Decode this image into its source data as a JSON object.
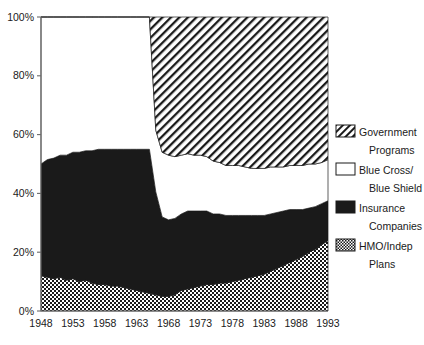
{
  "chart_data": {
    "type": "area",
    "title": "",
    "subtitle": "",
    "xlabel": "",
    "ylabel": "",
    "stacked": true,
    "stack_mode": "percent",
    "grid": false,
    "legend_position": "right",
    "xlim": [
      1948,
      1993
    ],
    "ylim": [
      0,
      100
    ],
    "xticks": [
      "1948",
      "1953",
      "1958",
      "1963",
      "1968",
      "1973",
      "1978",
      "1983",
      "1988",
      "1993"
    ],
    "xtick_values": [
      1948,
      1953,
      1958,
      1963,
      1968,
      1973,
      1978,
      1983,
      1988,
      1993
    ],
    "yticks": [
      "0%",
      "20%",
      "40%",
      "60%",
      "80%",
      "100%"
    ],
    "ytick_values": [
      0,
      20,
      40,
      60,
      80,
      100
    ],
    "x": [
      1948,
      1949,
      1950,
      1951,
      1952,
      1953,
      1954,
      1955,
      1956,
      1957,
      1958,
      1959,
      1960,
      1961,
      1962,
      1963,
      1964,
      1965,
      1966,
      1967,
      1968,
      1969,
      1970,
      1971,
      1972,
      1973,
      1974,
      1975,
      1976,
      1977,
      1978,
      1979,
      1980,
      1981,
      1982,
      1983,
      1984,
      1985,
      1986,
      1987,
      1988,
      1989,
      1990,
      1991,
      1992,
      1993
    ],
    "series": [
      {
        "name": "HMO/Indep Plans",
        "pattern": "checker",
        "order": 1,
        "values": [
          12,
          11.5,
          11,
          11.5,
          10.5,
          11,
          10,
          10.5,
          9.5,
          9,
          9,
          8.5,
          8.5,
          8,
          7.5,
          7,
          6.5,
          6,
          5.5,
          5,
          5,
          5.5,
          7,
          7.5,
          8,
          8.5,
          9,
          9,
          9.5,
          9.5,
          10,
          10.5,
          11,
          11.5,
          12,
          12.5,
          13.5,
          14.5,
          15.5,
          16.5,
          17.5,
          18.5,
          20,
          21,
          22.5,
          24
        ]
      },
      {
        "name": "Insurance Companies",
        "pattern": "solid-black",
        "order": 2,
        "values": [
          38,
          40,
          41,
          41.5,
          42.5,
          43,
          44,
          44,
          45,
          46,
          46,
          46.5,
          46.5,
          47,
          47.5,
          48,
          48.5,
          49,
          35,
          27,
          26,
          26,
          26,
          26.5,
          26,
          25.5,
          25,
          24,
          23.5,
          23,
          22.5,
          22,
          21.5,
          21,
          20.5,
          20,
          19.5,
          19,
          18.5,
          18,
          17,
          16,
          15,
          14.5,
          14,
          13.5
        ]
      },
      {
        "name": "Blue Cross/ Blue Shield",
        "pattern": "white",
        "order": 3,
        "values": [
          50,
          48.5,
          48,
          47,
          47,
          46,
          46,
          45.5,
          45.5,
          45,
          45,
          45,
          45,
          45,
          45,
          45,
          45,
          45,
          21,
          22,
          22,
          21,
          20,
          19.5,
          19,
          19,
          18.5,
          18,
          17.5,
          17,
          17,
          17,
          16.5,
          16,
          16,
          16,
          16,
          15.5,
          15,
          15,
          15,
          15,
          15,
          14.5,
          14,
          14
        ]
      },
      {
        "name": "Government Programs",
        "pattern": "diagonal-hatch",
        "order": 4,
        "values": [
          0,
          0,
          0,
          0,
          0,
          0,
          0,
          0,
          0,
          0,
          0,
          0,
          0,
          0,
          0,
          0,
          0,
          0,
          38.5,
          46,
          47,
          47.5,
          47,
          46.5,
          47,
          47,
          47.5,
          49,
          49.5,
          50.5,
          50.5,
          50.5,
          51,
          51.5,
          51.5,
          51.5,
          51,
          51,
          51,
          50.5,
          50.5,
          50.5,
          50,
          50,
          49.5,
          48.5
        ]
      }
    ]
  },
  "legend": {
    "items": [
      {
        "pattern": "diagonal-hatch",
        "line1": "Government",
        "line2": "Programs"
      },
      {
        "pattern": "white",
        "line1": "Blue Cross/",
        "line2": "Blue Shield"
      },
      {
        "pattern": "solid-black",
        "line1": "Insurance",
        "line2": "Companies"
      },
      {
        "pattern": "checker",
        "line1": "HMO/Indep",
        "line2": "Plans"
      }
    ]
  }
}
